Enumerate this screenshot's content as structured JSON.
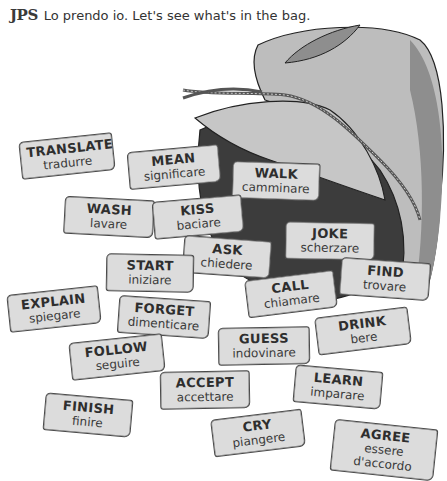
{
  "header": {
    "speaker_logo": "JPS",
    "line": "Lo prendo io. Let's see what's in the bag."
  },
  "illustration": {
    "subject": "cloth sack spilling word cards",
    "colors": {
      "bag_light": "#bdbdbd",
      "bag_mid": "#8e8e8e",
      "bag_dark": "#3c3c3c",
      "card_fill": "#dcdcdc",
      "outline": "#333333"
    }
  },
  "cards": [
    {
      "en": "TRANSLATE",
      "it": "tradurre"
    },
    {
      "en": "MEAN",
      "it": "significare"
    },
    {
      "en": "WALK",
      "it": "camminare"
    },
    {
      "en": "WASH",
      "it": "lavare"
    },
    {
      "en": "KISS",
      "it": "baciare"
    },
    {
      "en": "JOKE",
      "it": "scherzare"
    },
    {
      "en": "ASK",
      "it": "chiedere"
    },
    {
      "en": "START",
      "it": "iniziare"
    },
    {
      "en": "FIND",
      "it": "trovare"
    },
    {
      "en": "CALL",
      "it": "chiamare"
    },
    {
      "en": "EXPLAIN",
      "it": "spiegare"
    },
    {
      "en": "FORGET",
      "it": "dimenticare"
    },
    {
      "en": "DRINK",
      "it": "bere"
    },
    {
      "en": "GUESS",
      "it": "indovinare"
    },
    {
      "en": "FOLLOW",
      "it": "seguire"
    },
    {
      "en": "ACCEPT",
      "it": "accettare"
    },
    {
      "en": "LEARN",
      "it": "imparare"
    },
    {
      "en": "FINISH",
      "it": "finire"
    },
    {
      "en": "CRY",
      "it": "piangere"
    },
    {
      "en": "AGREE",
      "it": "essere d'accordo"
    }
  ]
}
